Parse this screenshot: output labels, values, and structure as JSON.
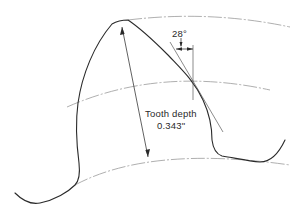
{
  "diagram": {
    "labels": {
      "angle": "28°",
      "tooth_depth_title": "Tooth depth",
      "tooth_depth_value": "0.343\""
    },
    "elements": [
      "tooth-outline",
      "addendum-circle-arc",
      "pitch-circle-arc",
      "root-circle-arc",
      "tooth-depth-dimension-arrow",
      "radial-reference-line",
      "tangent-line",
      "pressure-angle-indicator"
    ],
    "colors": {
      "outline": "#2a2a2a",
      "centerline": "#9a9a9a",
      "background": "#ffffff"
    }
  }
}
